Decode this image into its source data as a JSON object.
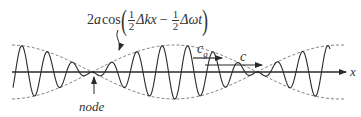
{
  "diagram": {
    "formula": {
      "prefix_coeff": "2",
      "prefix_var": "a",
      "func": "cos",
      "frac1_num": "1",
      "frac1_den": "2",
      "term1": "Δkx",
      "op": "−",
      "frac2_num": "1",
      "frac2_den": "2",
      "term2": "Δωt"
    },
    "labels": {
      "group_velocity": "c",
      "group_velocity_sub": "g",
      "phase_velocity": "c",
      "axis": "x",
      "node": "node"
    },
    "geometry": {
      "axis_y": 72,
      "axis_x_start": 12,
      "axis_x_end": 346,
      "node_positions_x": [
        92,
        257
      ],
      "envelope_amplitude": 27,
      "carrier_wavelength": 25.5
    },
    "colors": {
      "stroke": "#2a2a2a",
      "dashed": "#777777",
      "background": "#ffffff"
    }
  }
}
